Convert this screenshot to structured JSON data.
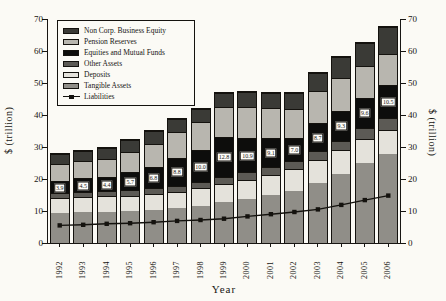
{
  "figure": {
    "xlabel": "Year",
    "ylabel_left": "$ (trillion)",
    "ylabel_right": "$ (trillion)",
    "yticks": [
      0,
      10,
      20,
      30,
      40,
      50,
      60,
      70
    ],
    "ymax": 70,
    "background": "#fbfaf5",
    "axis_color": "#171512"
  },
  "legend": {
    "items": [
      {
        "label": "Non Corp. Business Equity",
        "type": "bar",
        "color": "#3a3a36"
      },
      {
        "label": "Pension Reserves",
        "type": "bar",
        "color": "#b8b6af"
      },
      {
        "label": "Equities and Mutual Funds",
        "type": "bar",
        "color": "#0d0d0c"
      },
      {
        "label": "Other Assets",
        "type": "bar",
        "color": "#5c5a55"
      },
      {
        "label": "Deposits",
        "type": "bar",
        "color": "#e4e2db"
      },
      {
        "label": "Tangible Assets",
        "type": "bar",
        "color": "#908e88"
      },
      {
        "label": "Liabilities",
        "type": "line",
        "color": "#14120e"
      }
    ]
  },
  "chart_data": {
    "type": "bar",
    "subtype": "stacked-bars-with-line",
    "title": "",
    "xlabel": "Year",
    "ylabel": "$ (trillion)",
    "ylim": [
      0,
      70
    ],
    "grid": false,
    "legend_position": "upper-left-inside",
    "categories": [
      "1992",
      "1993",
      "1994",
      "1995",
      "1996",
      "1997",
      "1998",
      "1999",
      "2000",
      "2001",
      "2002",
      "2003",
      "2004",
      "2005",
      "2006"
    ],
    "stack_order": [
      "Tangible Assets",
      "Deposits",
      "Other Assets",
      "Equities and Mutual Funds",
      "Pension Reserves",
      "Non Corp. Business Equity"
    ],
    "series": [
      {
        "name": "Tangible Assets",
        "color": "#908e88",
        "values": [
          9.4,
          9.7,
          9.9,
          10.1,
          10.5,
          11.0,
          11.8,
          12.8,
          13.9,
          15.0,
          16.5,
          19.0,
          21.7,
          25.0,
          28.0
        ]
      },
      {
        "name": "Deposits",
        "color": "#e4e2db",
        "values": [
          4.7,
          4.7,
          4.8,
          4.8,
          4.9,
          5.1,
          5.4,
          5.7,
          6.0,
          6.3,
          6.7,
          7.0,
          7.4,
          7.8,
          7.6
        ]
      },
      {
        "name": "Other Assets",
        "color": "#5c5a55",
        "values": [
          1.6,
          1.6,
          1.7,
          1.7,
          1.8,
          1.9,
          2.0,
          2.2,
          2.3,
          2.5,
          2.7,
          2.9,
          3.1,
          3.3,
          3.5
        ]
      },
      {
        "name": "Equities and Mutual Funds",
        "color": "#0d0d0c",
        "values": [
          3.9,
          4.5,
          4.4,
          5.7,
          6.8,
          8.8,
          10.0,
          12.8,
          10.9,
          9.1,
          7.0,
          8.7,
          9.3,
          9.6,
          10.5
        ]
      },
      {
        "name": "Pension Reserves",
        "color": "#b8b6af",
        "values": [
          5.3,
          5.5,
          5.8,
          6.5,
          7.3,
          8.1,
          8.8,
          9.2,
          9.7,
          9.5,
          9.2,
          10.1,
          10.4,
          10.0,
          9.9
        ]
      },
      {
        "name": "Non Corp. Business Equity",
        "color": "#3a3a36",
        "values": [
          3.1,
          3.2,
          3.3,
          3.8,
          3.9,
          4.1,
          4.2,
          4.4,
          4.6,
          4.9,
          5.2,
          5.8,
          6.4,
          7.2,
          8.4
        ]
      }
    ],
    "line_series": {
      "name": "Liabilities",
      "color": "#14120e",
      "marker": "square",
      "values": [
        5.5,
        5.7,
        6.0,
        6.2,
        6.5,
        6.9,
        7.2,
        7.6,
        8.3,
        9.0,
        9.7,
        10.5,
        11.9,
        13.4,
        14.8
      ]
    },
    "bar_value_labels": {
      "series": "Equities and Mutual Funds",
      "labels": [
        "3.9",
        "4.5",
        "4.4",
        "5.7",
        "6.8",
        "8.8",
        "10.0",
        "12.8",
        "10.9",
        "9.1",
        "7.0",
        "8.7",
        "9.3",
        "9.6",
        "10.5"
      ]
    }
  }
}
